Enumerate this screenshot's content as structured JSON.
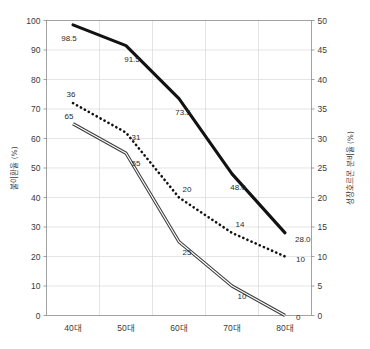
{
  "chart_data": {
    "type": "line",
    "title": "",
    "subtitle": "",
    "xlabel": "",
    "ylabel": "불이환율 (%)",
    "y2label": "성장호르몬 분비율 (%)",
    "categories": [
      "40대",
      "50대",
      "60대",
      "70대",
      "80대"
    ],
    "ylim": [
      0,
      100
    ],
    "y2lim": [
      0,
      50
    ],
    "yticks": [
      "0",
      "10",
      "20",
      "30",
      "40",
      "50",
      "60",
      "70",
      "80",
      "90",
      "100"
    ],
    "y2ticks": [
      "0",
      "5",
      "10",
      "15",
      "20",
      "25",
      "30",
      "35",
      "40",
      "45",
      "50"
    ],
    "grid": true,
    "legend": "none",
    "series": [
      {
        "name": "불이환율-굵은선",
        "axis": "left",
        "style": "solid-thick",
        "values": [
          98.5,
          91.5,
          73.5,
          48.0,
          28.0
        ],
        "labels": [
          "98.5",
          "91.5",
          "73.5",
          "48.0",
          "28.0"
        ]
      },
      {
        "name": "성장호르몬-점선",
        "axis": "right",
        "style": "dotted",
        "values": [
          36,
          31,
          20,
          14,
          10
        ],
        "labels": [
          "36",
          "31",
          "20",
          "14",
          "10"
        ]
      },
      {
        "name": "불이환율-이중선",
        "axis": "left",
        "style": "double-line",
        "values": [
          65,
          55,
          25,
          10,
          0
        ],
        "labels": [
          "65",
          "55",
          "25",
          "10",
          "0"
        ]
      }
    ]
  },
  "axes": {
    "left_title": "불이환율 (%)",
    "right_title": "성장호르몬 분비율 (%)",
    "x_categories": [
      "40대",
      "50대",
      "60대",
      "70대",
      "80대"
    ],
    "left_ticks": [
      "100",
      "90",
      "80",
      "70",
      "60",
      "50",
      "40",
      "30",
      "20",
      "10",
      "0"
    ],
    "right_ticks": [
      "50",
      "45",
      "40",
      "35",
      "30",
      "25",
      "20",
      "15",
      "10",
      "5",
      "0"
    ]
  },
  "colors": {
    "background": "#ffffff",
    "grid": "#d9d9d9",
    "frame": "#8c8c8c",
    "series_line": "#121212",
    "text": "#3a3a3a"
  }
}
